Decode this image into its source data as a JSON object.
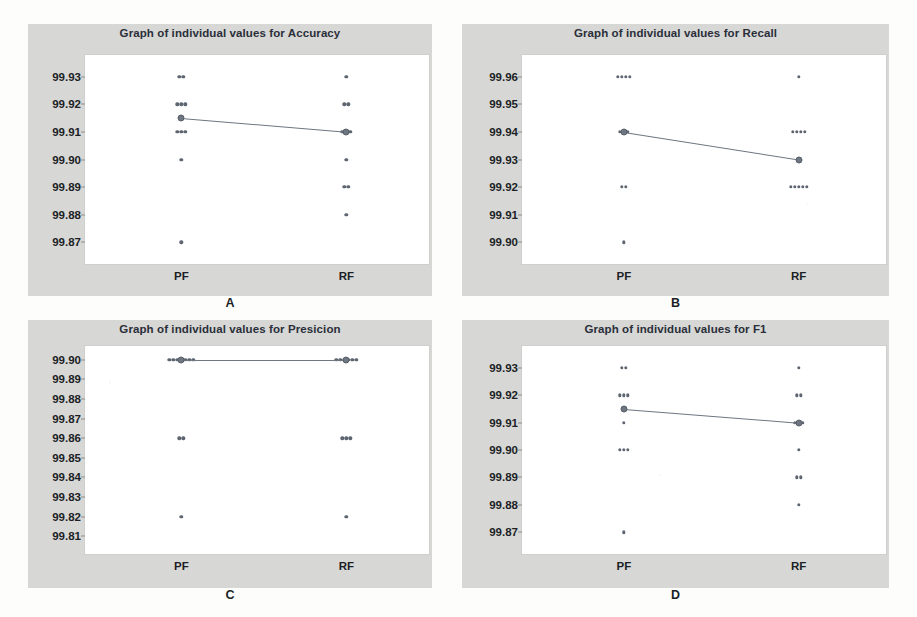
{
  "figure": {
    "background_color": "#fdfdfb",
    "panel_background_color": "#d7d7d5",
    "plot_background_color": "#ffffff",
    "marker_color": "#5d6570",
    "mean_color": "#6e7682"
  },
  "panels": [
    {
      "letter": "A",
      "title": "Graph of individual values for Accuracy",
      "chart_data": {
        "type": "scatter",
        "title": "Graph of individual values for Accuracy",
        "xlabel": "",
        "ylabel": "",
        "categories": [
          "PF",
          "RF"
        ],
        "yticks": [
          "99.93",
          "99.92",
          "99.91",
          "99.90",
          "99.89",
          "99.88",
          "99.87"
        ],
        "ylim": [
          99.865,
          99.935
        ],
        "grid": false,
        "legend": "none",
        "series": [
          {
            "name": "PF",
            "values": [
              99.93,
              99.93,
              99.92,
              99.92,
              99.92,
              99.91,
              99.91,
              99.91,
              99.9,
              99.87
            ],
            "mean": 99.915
          },
          {
            "name": "RF",
            "values": [
              99.93,
              99.92,
              99.92,
              99.91,
              99.91,
              99.91,
              99.9,
              99.89,
              99.89,
              99.88
            ],
            "mean": 99.91
          }
        ]
      }
    },
    {
      "letter": "B",
      "title": "Graph of individual values for Recall",
      "chart_data": {
        "type": "scatter",
        "title": "Graph of individual values for Recall",
        "xlabel": "",
        "ylabel": "",
        "categories": [
          "PF",
          "RF"
        ],
        "yticks": [
          "99.96",
          "99.95",
          "99.94",
          "99.93",
          "99.92",
          "99.91",
          "99.90"
        ],
        "ylim": [
          99.895,
          99.965
        ],
        "grid": false,
        "legend": "none",
        "series": [
          {
            "name": "PF",
            "values": [
              99.96,
              99.96,
              99.96,
              99.96,
              99.94,
              99.94,
              99.94,
              99.92,
              99.92,
              99.9
            ],
            "mean": 99.94
          },
          {
            "name": "RF",
            "values": [
              99.96,
              99.94,
              99.94,
              99.94,
              99.94,
              99.92,
              99.92,
              99.92,
              99.92,
              99.92
            ],
            "mean": 99.93
          }
        ]
      }
    },
    {
      "letter": "C",
      "title": "Graph of individual values for Presicion",
      "chart_data": {
        "type": "scatter",
        "title": "Graph of individual values for Presicion",
        "xlabel": "",
        "ylabel": "",
        "categories": [
          "PF",
          "RF"
        ],
        "yticks": [
          "99.90",
          "99.89",
          "99.88",
          "99.87",
          "99.86",
          "99.85",
          "99.84",
          "99.83",
          "99.82",
          "99.81"
        ],
        "ylim": [
          99.805,
          99.903
        ],
        "grid": false,
        "legend": "none",
        "series": [
          {
            "name": "PF",
            "values": [
              99.9,
              99.9,
              99.9,
              99.9,
              99.9,
              99.9,
              99.9,
              99.86,
              99.86,
              99.82
            ],
            "mean": 99.9
          },
          {
            "name": "RF",
            "values": [
              99.9,
              99.9,
              99.9,
              99.9,
              99.9,
              99.9,
              99.86,
              99.86,
              99.86,
              99.82
            ],
            "mean": 99.9
          }
        ]
      }
    },
    {
      "letter": "D",
      "title": "Graph of individual values for F1",
      "chart_data": {
        "type": "scatter",
        "title": "Graph of individual values for F1",
        "xlabel": "",
        "ylabel": "",
        "categories": [
          "PF",
          "RF"
        ],
        "yticks": [
          "99.93",
          "99.92",
          "99.91",
          "99.90",
          "99.89",
          "99.88",
          "99.87"
        ],
        "ylim": [
          99.865,
          99.935
        ],
        "grid": false,
        "legend": "none",
        "series": [
          {
            "name": "PF",
            "values": [
              99.93,
              99.93,
              99.92,
              99.92,
              99.92,
              99.91,
              99.9,
              99.9,
              99.9,
              99.87
            ],
            "mean": 99.915
          },
          {
            "name": "RF",
            "values": [
              99.93,
              99.92,
              99.92,
              99.91,
              99.91,
              99.91,
              99.9,
              99.89,
              99.89,
              99.88
            ],
            "mean": 99.91
          }
        ]
      }
    }
  ]
}
